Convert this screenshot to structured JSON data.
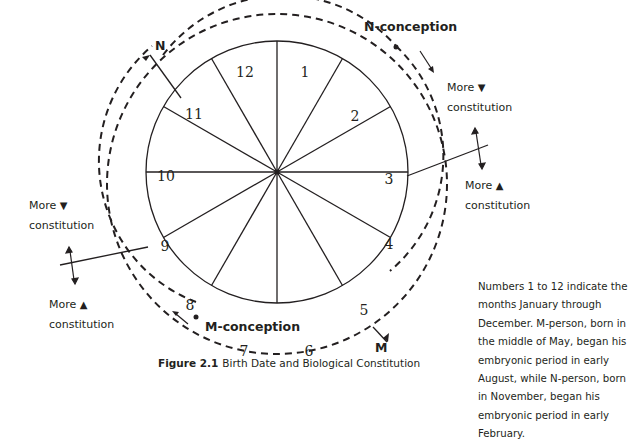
{
  "figure": {
    "caption_label": "Figure 2.1",
    "caption_title": "Birth Date and Biological Constitution"
  },
  "wheel": {
    "months": [
      "1",
      "2",
      "3",
      "4",
      "5",
      "6",
      "7",
      "8",
      "9",
      "10",
      "11",
      "12"
    ],
    "center": [
      277,
      172
    ],
    "radius": 131
  },
  "markers": {
    "n_birth": "N",
    "m_birth": "M",
    "n_conception": "N-conception",
    "m_conception": "M-conception"
  },
  "annotations": {
    "right_upper": {
      "word": "More",
      "symbol": "▼",
      "line2": "constitution"
    },
    "right_lower": {
      "word": "More",
      "symbol": "▲",
      "line2": "constitution"
    },
    "left_upper": {
      "word": "More",
      "symbol": "▼",
      "line2": "constitution"
    },
    "left_lower": {
      "word": "More",
      "symbol": "▲",
      "line2": "constitution"
    }
  },
  "note": "Numbers 1 to 12 indicate the months January through December. M-person, born in the middle of May, began his embryonic period in early August, while N-person, born in November, began his embryonic period in early February.",
  "colors": {
    "ink": "#231f20",
    "background": "#ffffff"
  }
}
